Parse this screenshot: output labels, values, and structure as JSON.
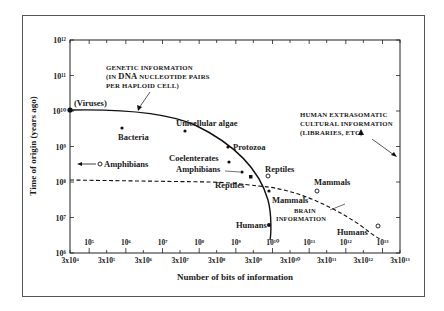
{
  "chart_data": {
    "type": "scatter",
    "title": "",
    "xlabel": "Number of bits of information",
    "ylabel": "Time of origin (years ago)",
    "xscale": "log",
    "yscale": "log",
    "xlim": [
      30000,
      30000000000000
    ],
    "ylim": [
      1000000,
      1000000000000
    ],
    "x_tick_labels_bottom": [
      "3x10⁴",
      "3x10⁵",
      "3x10⁶",
      "3x10⁷",
      "3x10⁸",
      "3x10⁹",
      "3x10¹⁰",
      "3x10¹¹",
      "3x10¹²",
      "3x10¹³"
    ],
    "x_tick_labels_inner": [
      "10⁵",
      "10⁶",
      "10⁷",
      "10⁸",
      "10⁹",
      "10¹⁰",
      "10¹¹",
      "10¹²",
      "10¹³"
    ],
    "y_tick_labels": [
      "10¹²",
      "10¹¹",
      "10¹⁰",
      "10⁹",
      "10⁸",
      "10⁷",
      "10⁶"
    ],
    "grid": false,
    "annotations": [
      {
        "text": "GENETIC INFORMATION (IN DNA NUCLEOTIDE PAIRS PER HAPLOID CELL)",
        "points_to": "genetic curve"
      },
      {
        "text": "HUMAN EXTRASOMATIC CULTURAL INFORMATION (LIBRARIES, ETC)",
        "marker": "triangle"
      },
      {
        "text": "BRAIN INFORMATION",
        "points_to": "brain curve (dashed)"
      }
    ],
    "series": [
      {
        "name": "Genetic information",
        "style": "solid line, filled dots",
        "points": [
          {
            "label": "(Viruses)",
            "x": 30000,
            "y": 4000000000
          },
          {
            "label": "Bacteria",
            "x": 1000000,
            "y": 2500000000
          },
          {
            "label": "Unicellular algae",
            "x": 50000000,
            "y": 2500000000
          },
          {
            "label": "Protozoa",
            "x": 100000000,
            "y": 1000000000
          },
          {
            "label": "Coelenterates",
            "x": 90000000,
            "y": 350000000
          },
          {
            "label": "Amphibians",
            "x": 300000000,
            "y": 180000000
          },
          {
            "label": "Reptiles",
            "x": 800000000,
            "y": 140000000
          },
          {
            "label": "Mammals",
            "x": 3000000000,
            "y": 60000000
          },
          {
            "label": "Humans",
            "x": 3000000000,
            "y": 5000000
          }
        ]
      },
      {
        "name": "Brain information",
        "style": "dashed line, open circles",
        "points": [
          {
            "label": "Amphibians",
            "x": 700000,
            "y": 250000000
          },
          {
            "label": "Reptiles",
            "x": 3000000000,
            "y": 150000000
          },
          {
            "label": "Mammals",
            "x": 300000000000,
            "y": 60000000
          },
          {
            "label": "Humans",
            "x": 10000000000000,
            "y": 4000000
          }
        ]
      }
    ]
  }
}
